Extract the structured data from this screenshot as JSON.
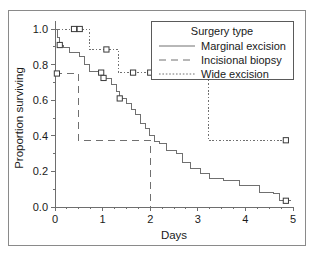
{
  "chart_data": {
    "type": "line",
    "title": "",
    "xlabel": "Days",
    "ylabel": "Proportion surviving",
    "xlim": [
      0,
      5
    ],
    "ylim": [
      0.0,
      1.0
    ],
    "xticks": [
      0,
      1,
      2,
      3,
      4,
      5
    ],
    "xtick_labels": [
      "0",
      "1",
      "2",
      "3",
      "4",
      "5"
    ],
    "yticks": [
      0.0,
      0.2,
      0.4,
      0.6,
      0.8,
      1.0
    ],
    "ytick_labels": [
      "0.0",
      "0.2",
      "0.4",
      "0.6",
      "0.8",
      "1.0"
    ],
    "minor_xticks": [
      0.25,
      0.5,
      0.75,
      1.25,
      1.5,
      1.75,
      2.25,
      2.5,
      2.75,
      3.25,
      3.5,
      3.75,
      4.25,
      4.5,
      4.75
    ],
    "minor_yticks": [
      0.1,
      0.3,
      0.5,
      0.7,
      0.9
    ],
    "grid": false,
    "legend_position": "top-right",
    "legend_title": "Surgery type",
    "series": [
      {
        "name": "Marginal excision",
        "style": "solid",
        "dash": "none",
        "color": "#707070",
        "steps": [
          [
            0.0,
            1.0
          ],
          [
            0.06,
            0.955
          ],
          [
            0.1,
            0.91
          ],
          [
            0.18,
            0.895
          ],
          [
            0.3,
            0.87
          ],
          [
            0.52,
            0.845
          ],
          [
            0.62,
            0.8
          ],
          [
            0.72,
            0.76
          ],
          [
            0.95,
            0.755
          ],
          [
            1.0,
            0.73
          ],
          [
            1.05,
            0.72
          ],
          [
            1.18,
            0.69
          ],
          [
            1.3,
            0.65
          ],
          [
            1.36,
            0.61
          ],
          [
            1.5,
            0.58
          ],
          [
            1.6,
            0.55
          ],
          [
            1.7,
            0.52
          ],
          [
            1.8,
            0.47
          ],
          [
            1.9,
            0.44
          ],
          [
            1.98,
            0.4
          ],
          [
            2.08,
            0.37
          ],
          [
            2.2,
            0.355
          ],
          [
            2.35,
            0.32
          ],
          [
            2.55,
            0.3
          ],
          [
            2.68,
            0.25
          ],
          [
            2.85,
            0.215
          ],
          [
            3.05,
            0.19
          ],
          [
            3.25,
            0.16
          ],
          [
            3.55,
            0.15
          ],
          [
            3.88,
            0.12
          ],
          [
            4.3,
            0.08
          ],
          [
            4.58,
            0.075
          ],
          [
            4.72,
            0.035
          ],
          [
            4.95,
            0.035
          ]
        ],
        "censors": [
          [
            0.1,
            0.91
          ],
          [
            0.97,
            0.755
          ],
          [
            1.02,
            0.725
          ],
          [
            1.36,
            0.61
          ],
          [
            4.85,
            0.035
          ]
        ]
      },
      {
        "name": "Incisional biopsy",
        "style": "dashed",
        "dash": "7,5",
        "color": "#707070",
        "steps": [
          [
            0.0,
            0.75
          ],
          [
            0.5,
            0.75
          ],
          [
            0.5,
            0.375
          ],
          [
            2.0,
            0.375
          ],
          [
            2.0,
            0.0
          ]
        ],
        "censors": [
          [
            0.04,
            0.75
          ]
        ]
      },
      {
        "name": "Wide excision",
        "style": "dotted",
        "dash": "1.6,1.8",
        "color": "#707070",
        "steps": [
          [
            0.0,
            1.0
          ],
          [
            0.72,
            1.0
          ],
          [
            0.72,
            0.885
          ],
          [
            1.33,
            0.885
          ],
          [
            1.33,
            0.755
          ],
          [
            3.22,
            0.755
          ],
          [
            3.22,
            0.375
          ],
          [
            4.88,
            0.375
          ]
        ],
        "censors": [
          [
            0.4,
            1.0
          ],
          [
            0.52,
            1.0
          ],
          [
            1.08,
            0.885
          ],
          [
            1.64,
            0.755
          ],
          [
            2.0,
            0.755
          ],
          [
            2.18,
            0.755
          ],
          [
            3.18,
            0.755
          ],
          [
            4.85,
            0.375
          ]
        ]
      }
    ]
  }
}
